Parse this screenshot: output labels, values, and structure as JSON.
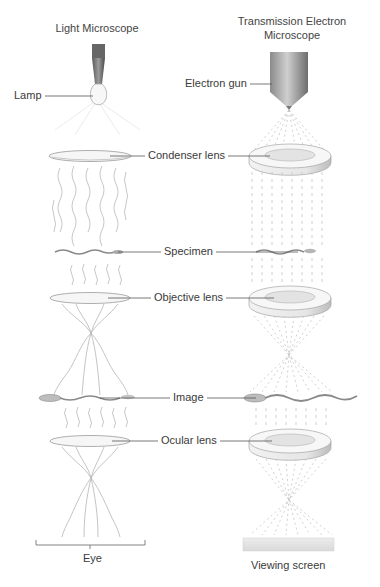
{
  "diagram": {
    "columns": [
      {
        "id": "light",
        "title": "Light Microscope"
      },
      {
        "id": "tem",
        "title_line1": "Transmission Electron",
        "title_line2": "Microscope"
      }
    ],
    "labels": {
      "lamp": "Lamp",
      "electron_gun": "Electron gun",
      "condenser_lens": "Condenser lens",
      "specimen": "Specimen",
      "objective_lens": "Objective lens",
      "image": "Image",
      "ocular_lens": "Ocular lens",
      "eye": "Eye",
      "viewing_screen": "Viewing screen"
    },
    "colors": {
      "text": "#3a3a3a",
      "leader_line": "#555555",
      "lens_stroke": "#9a9a9a",
      "wave": "#b5b5b5",
      "beam": "#c4c4c4",
      "metal_dark": "#6a6a6a",
      "screen": "#e4e4e4"
    }
  }
}
